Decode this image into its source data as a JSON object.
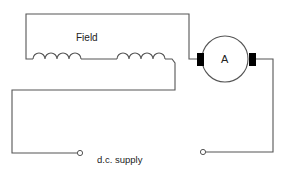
{
  "diagram": {
    "type": "circuit",
    "title": "",
    "labels": {
      "field": "Field",
      "armature": "A",
      "supply": "d.c. supply"
    },
    "components": [
      {
        "id": "field-winding",
        "kind": "inductor-coil",
        "label": "Field",
        "segments": 2
      },
      {
        "id": "armature",
        "kind": "motor-armature",
        "label": "A",
        "brushes": 2
      },
      {
        "id": "supply-terminals",
        "kind": "terminal-pair",
        "label": "d.c. supply"
      }
    ],
    "colors": {
      "wire": "#555555",
      "brush": "#000000",
      "text": "#222222",
      "background": "#ffffff"
    }
  }
}
